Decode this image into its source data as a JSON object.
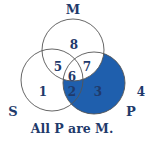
{
  "diagram": {
    "type": "venn-3-set",
    "sets": {
      "M": {
        "label": "M"
      },
      "S": {
        "label": "S"
      },
      "P": {
        "label": "P"
      }
    },
    "regions": [
      {
        "id": "1",
        "label": "1",
        "shaded": false
      },
      {
        "id": "2",
        "label": "2",
        "shaded": true
      },
      {
        "id": "3",
        "label": "3",
        "shaded": true
      },
      {
        "id": "4",
        "label": "4",
        "shaded": false
      },
      {
        "id": "5",
        "label": "5",
        "shaded": false
      },
      {
        "id": "6",
        "label": "6",
        "shaded": false
      },
      {
        "id": "7",
        "label": "7",
        "shaded": false
      },
      {
        "id": "8",
        "label": "8",
        "shaded": false
      }
    ],
    "caption": "All P are M.",
    "colors": {
      "shade": "#1f5fad",
      "text": "#1f3a6b",
      "outline": "#555555"
    }
  }
}
